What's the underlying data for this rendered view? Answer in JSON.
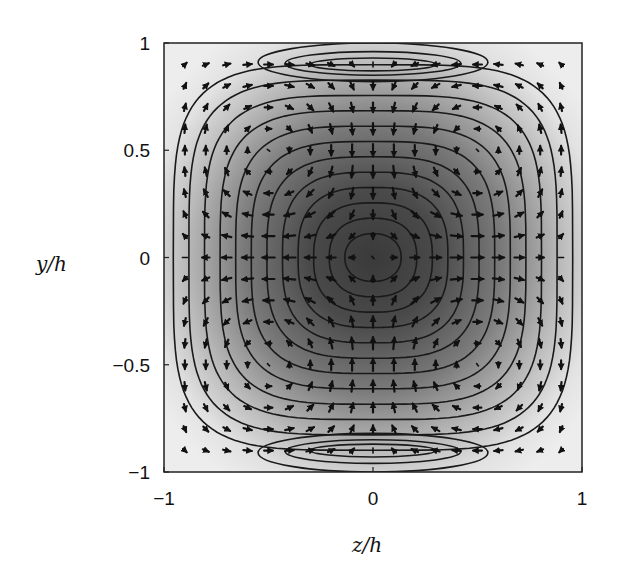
{
  "chart_data": {
    "type": "contour+quiver",
    "title": "",
    "xlabel": "z/h",
    "ylabel": "y/h",
    "xlim": [
      -1,
      1
    ],
    "ylim": [
      -1,
      1
    ],
    "xticks": [
      -1,
      0,
      1
    ],
    "xtick_labels": [
      "−1",
      "0",
      "1"
    ],
    "yticks": [
      -1,
      -0.5,
      0,
      0.5,
      1
    ],
    "ytick_labels": [
      "−1",
      "−0.5",
      "0",
      "0.5",
      "1"
    ],
    "grid": false,
    "legend": null,
    "colormap": "grayscale (dark = high streamwise velocity at center, light near walls)",
    "contour_field": {
      "description": "Streamwise velocity contours, maximum at (0,0), decaying to walls; closed lobes near top and bottom walls around z in [-0.55, 0.55]",
      "max_location": [
        0,
        0
      ],
      "levels": 12
    },
    "vector_field": {
      "description": "Secondary flow: four-cell pattern; flow moves inward along y=0 from side walls, outward along z=0 toward top/bottom walls, spreads along top/bottom walls and returns down side walls",
      "grid_spacing": 0.1,
      "symmetry": "symmetric about z=0 and y=0"
    }
  },
  "axes": {
    "x_label": "z/h",
    "y_label": "y/h",
    "x_tick_labels": [
      "−1",
      "0",
      "1"
    ],
    "y_tick_labels": [
      "1",
      "0.5",
      "0",
      "−0.5",
      "−1"
    ]
  }
}
